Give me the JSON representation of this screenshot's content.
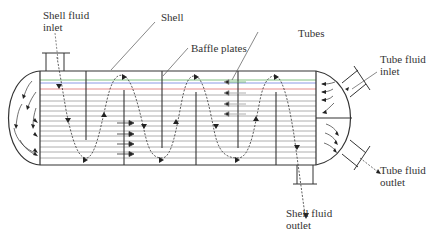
{
  "diagram": {
    "labels": {
      "shell_fluid_inlet": [
        "Shell fluid",
        "inlet"
      ],
      "shell": "Shell",
      "baffle_plates": "Baffle plates",
      "tubes": "Tubes",
      "tube_fluid_inlet": [
        "Tube fluid",
        "inlet"
      ],
      "tube_fluid_outlet": [
        "Tube fluid",
        "outlet"
      ],
      "shell_fluid_outlet": [
        "Shell fluid",
        "outlet"
      ]
    },
    "colors": {
      "stroke": "#333333",
      "tube_red": "#e07070",
      "tube_blue": "#7080e0",
      "tube_green": "#60b060",
      "tube_default": "#9a9a9a"
    },
    "baffles": {
      "count": 6,
      "top_hanging": 3,
      "bottom_standing": 3
    },
    "tube_count": 16
  }
}
